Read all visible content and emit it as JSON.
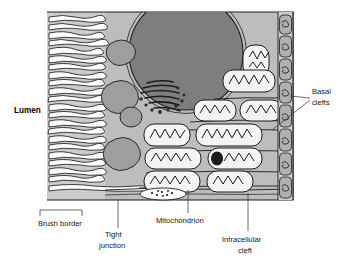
{
  "figure": {
    "type": "biological-cell-diagram"
  },
  "labels": {
    "lumen": "Lumen",
    "brush_border": "Brush border",
    "tight_junction_line1": "Tight",
    "tight_junction_line2": "junction",
    "mitochondrion": "Mitochondrion",
    "intracellular_cleft_line1": "Intracellular",
    "intracellular_cleft_line2": "cleft",
    "basal_clefts_line1": "Basal",
    "basal_clefts_line2": "clefts"
  },
  "structures": {
    "microvilli_count": 22,
    "nucleus": "nucleus",
    "golgi_apparatus": "golgi-apparatus",
    "vesicles": "secretory-vesicles",
    "mitochondria_count": 13,
    "basal_cleft_rows": 5,
    "lateral_cleft_stack_count": 8
  },
  "colors": {
    "background": "#ffffff",
    "cytoplasm": "#b9b9b9",
    "cytoplasm_light": "#cfcfcf",
    "nucleus_fill": "#7e7e7e",
    "organelle_fill": "#9a9a9a",
    "outline": "#1c1c1c",
    "mitochondria_fill": "#f2f2f2",
    "label_text": "#161616",
    "leader_line": "#3a3a3a"
  }
}
